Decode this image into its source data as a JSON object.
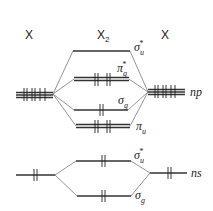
{
  "diagram": {
    "type": "molecular-orbital-diagram",
    "headers": {
      "left_atom": "X",
      "molecule": "X",
      "molecule_subscript": "2",
      "right_atom": "X"
    },
    "atomic_orbitals": {
      "np": {
        "label": "np",
        "electrons_each_side": 4
      },
      "ns": {
        "label": "ns",
        "electrons_each_side": 2
      }
    },
    "molecular_orbitals": [
      {
        "id": "sigma_u_star_p",
        "symbol": "σ",
        "sub": "u",
        "sup": "*",
        "electrons": 0,
        "degenerate": 1
      },
      {
        "id": "pi_g_star",
        "symbol": "π",
        "sub": "g",
        "sup": "*",
        "electrons": 4,
        "degenerate": 2
      },
      {
        "id": "sigma_g_p",
        "symbol": "σ",
        "sub": "g",
        "sup": "",
        "electrons": 2,
        "degenerate": 1
      },
      {
        "id": "pi_u",
        "symbol": "π",
        "sub": "u",
        "sup": "",
        "electrons": 4,
        "degenerate": 2
      },
      {
        "id": "sigma_u_star_s",
        "symbol": "σ",
        "sub": "u",
        "sup": "*",
        "electrons": 2,
        "degenerate": 1
      },
      {
        "id": "sigma_g_s",
        "symbol": "σ",
        "sub": "g",
        "sup": "",
        "electrons": 2,
        "degenerate": 1
      }
    ]
  }
}
